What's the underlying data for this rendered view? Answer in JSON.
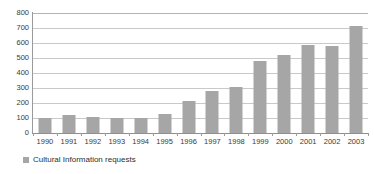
{
  "chart_data": {
    "type": "bar",
    "title": "",
    "subtitle": "",
    "xlabel": "",
    "ylabel": "",
    "ylim": [
      0,
      800
    ],
    "ytick_step": 100,
    "yticks": [
      "800",
      "700",
      "600",
      "500",
      "400",
      "300",
      "200",
      "100",
      "0"
    ],
    "grid": true,
    "legend_position": "bottom-left",
    "categories": [
      "1990",
      "1991",
      "1992",
      "1993",
      "1994",
      "1995",
      "1996",
      "1997",
      "1998",
      "1999",
      "2000",
      "2001",
      "2002",
      "2003"
    ],
    "series": [
      {
        "name": "Cultural Information requests",
        "color": "#a6a6a6",
        "values": [
          100,
          120,
          105,
          100,
          100,
          130,
          215,
          280,
          310,
          480,
          520,
          590,
          580,
          715
        ]
      }
    ]
  },
  "legend": {
    "items": [
      {
        "label": "Cultural Information requests",
        "color": "#a6a6a6"
      }
    ]
  },
  "colors": {
    "bar": "#a6a6a6",
    "gridline": "#c9c9c9",
    "axis": "#9a9a9a",
    "text": "#3a3a3a",
    "background": "#ffffff"
  }
}
